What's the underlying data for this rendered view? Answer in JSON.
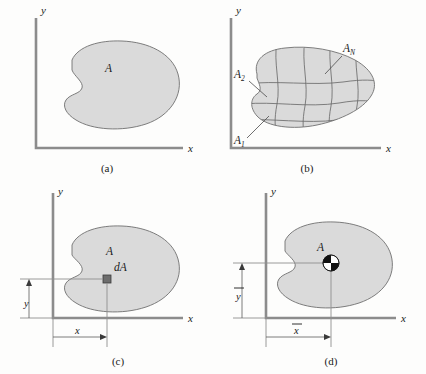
{
  "figure": {
    "type": "engineering-mechanics-centroid-diagram",
    "panel_count": 4,
    "colors": {
      "area_fill": "#dadada",
      "area_outline": "#6f6f6f",
      "axis": "#8c8c8c",
      "text": "#1a1a1a",
      "differential_element": "#6d6d6d",
      "centroid_black": "#111111",
      "centroid_white": "#ffffff",
      "background": "#fdfdfc"
    }
  },
  "panels": {
    "a": {
      "caption": "(a)",
      "x_axis_label": "x",
      "y_axis_label": "y",
      "area_label": "A"
    },
    "b": {
      "caption": "(b)",
      "x_axis_label": "x",
      "y_axis_label": "y",
      "element_labels": [
        {
          "base": "A",
          "subscript": "1"
        },
        {
          "base": "A",
          "subscript": "2"
        },
        {
          "base": "A",
          "subscript": "N"
        }
      ]
    },
    "c": {
      "caption": "(c)",
      "x_axis_label": "x",
      "y_axis_label": "y",
      "area_label": "A",
      "element_label": "dA",
      "dim_x_label": "x",
      "dim_y_label": "y"
    },
    "d": {
      "caption": "(d)",
      "x_axis_label": "x",
      "y_axis_label": "y",
      "area_label": "A",
      "dim_x_label": "x",
      "dim_y_label": "y",
      "centroid_marker": "centroid-symbol"
    }
  }
}
